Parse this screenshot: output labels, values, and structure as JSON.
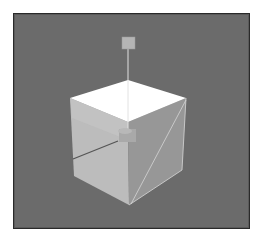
{
  "viewport": {
    "label": "3D viewport",
    "background_color": "#6b6b6b",
    "border_color": "#2a2a2a"
  },
  "scene": {
    "object": "cube",
    "faces": {
      "top_color": "#ffffff",
      "left_color": "#bdbdbd",
      "right_color": "#9a9a9a"
    },
    "gizmo": {
      "handle_color": "#b5b5b5",
      "axis_line_color": "#dcdcdc",
      "center_handle_color": "#a8a8a8"
    },
    "edge_highlight_color": "#d0d0d0"
  }
}
